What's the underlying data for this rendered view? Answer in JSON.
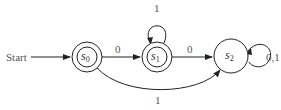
{
  "diagram": {
    "type": "finite-state-automaton",
    "start_label": "Start",
    "states": [
      {
        "id": "s0",
        "base": "s",
        "sub": "0",
        "accepting": true,
        "start": true
      },
      {
        "id": "s1",
        "base": "s",
        "sub": "1",
        "accepting": true,
        "start": false
      },
      {
        "id": "s2",
        "base": "s",
        "sub": "2",
        "accepting": false,
        "start": false
      }
    ],
    "transitions": [
      {
        "from": "s0",
        "to": "s1",
        "label": "0"
      },
      {
        "from": "s1",
        "to": "s1",
        "label": "1"
      },
      {
        "from": "s1",
        "to": "s2",
        "label": "0"
      },
      {
        "from": "s2",
        "to": "s2",
        "label": "0,1"
      },
      {
        "from": "s0",
        "to": "s2",
        "label": "1"
      }
    ]
  }
}
